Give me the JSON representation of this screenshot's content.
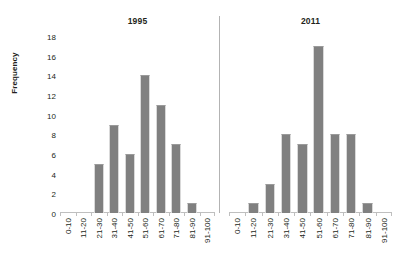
{
  "chart_data": {
    "type": "bar",
    "title": "",
    "xlabel": "",
    "ylabel": "Frequency",
    "ylim": [
      0,
      18
    ],
    "ytick_step": 2,
    "yticks": [
      18,
      16,
      14,
      12,
      10,
      8,
      6,
      4,
      2,
      0
    ],
    "grid": false,
    "legend": "none",
    "orientation": "vertical",
    "panels": [
      {
        "title": "1995",
        "categories": [
          "0-10",
          "11-20",
          "21-30",
          "31-40",
          "41-50",
          "51-60",
          "61-70",
          "71-80",
          "81-90",
          "91-100"
        ],
        "values": [
          0,
          0,
          5,
          9,
          6,
          14,
          11,
          7,
          1,
          0
        ]
      },
      {
        "title": "2011",
        "categories": [
          "0-10",
          "11-20",
          "21-30",
          "31-40",
          "41-50",
          "51-60",
          "61-70",
          "71-80",
          "81-90",
          "91-100"
        ],
        "values": [
          0,
          1,
          3,
          8,
          7,
          17,
          8,
          8,
          1,
          0
        ]
      }
    ],
    "colors": {
      "bar": "#808080",
      "axis": "#bfbfbf",
      "divider": "#b3b3b3",
      "text": "#231f20",
      "background": "#ffffff"
    }
  }
}
